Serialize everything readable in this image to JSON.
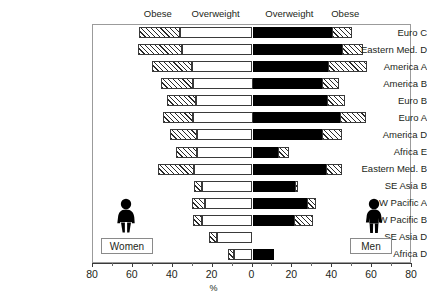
{
  "chart_data": {
    "type": "bar",
    "orientation": "horizontal-diverging",
    "title": "",
    "xlabel": "%",
    "ylabel": "",
    "xlim": [
      -80,
      80
    ],
    "xticks": [
      -80,
      -60,
      -40,
      -20,
      0,
      20,
      40,
      60,
      80
    ],
    "xticklabels": [
      "80",
      "60",
      "40",
      "20",
      "0",
      "20",
      "40",
      "60",
      "80"
    ],
    "minor_tick_step": 10,
    "grid": false,
    "legend_position": "inline-figures",
    "header_labels": [
      {
        "text": "Obese",
        "side": "women"
      },
      {
        "text": "Overweight",
        "side": "women"
      },
      {
        "text": "Overweight",
        "side": "men"
      },
      {
        "text": "Obese",
        "side": "men"
      }
    ],
    "categories": [
      "Euro C",
      "Eastern Med. D",
      "America A",
      "America B",
      "Euro B",
      "Euro A",
      "America D",
      "Africa E",
      "Eastern Med. B",
      "SE Asia B",
      "W Pacific A",
      "W Pacific B",
      "SE Asia D",
      "Africa D"
    ],
    "series": [
      {
        "name": "Women overweight",
        "side": "left",
        "pattern": "white",
        "values": [
          36.5,
          35.5,
          30.5,
          30.0,
          28.5,
          30.0,
          28.0,
          28.0,
          29.5,
          25.5,
          24.0,
          25.5,
          18.0,
          9.5
        ]
      },
      {
        "name": "Women obese",
        "side": "left",
        "pattern": "hatched",
        "values": [
          20.5,
          22.0,
          20.0,
          16.0,
          14.5,
          15.0,
          13.5,
          10.5,
          18.0,
          4.0,
          6.5,
          4.5,
          4.0,
          3.0
        ]
      },
      {
        "name": "Men overweight",
        "side": "right",
        "pattern": "black",
        "values": [
          40.0,
          45.0,
          38.0,
          35.0,
          37.5,
          44.0,
          35.0,
          13.0,
          37.0,
          21.5,
          27.5,
          21.0,
          0.0,
          11.0
        ]
      },
      {
        "name": "Men obese",
        "side": "right",
        "pattern": "hatched",
        "values": [
          10.0,
          10.5,
          19.5,
          8.5,
          9.0,
          13.0,
          10.0,
          5.5,
          8.0,
          1.5,
          4.5,
          9.5,
          0.0,
          0.0
        ]
      }
    ]
  },
  "legend": {
    "women_label": "Women",
    "men_label": "Men",
    "women_icon": "female-figure-icon",
    "men_icon": "male-figure-icon"
  },
  "colors": {
    "black": "#000000",
    "white": "#ffffff",
    "outline": "#3a3a3a",
    "frame": "#9b9b9b",
    "text": "#231f20"
  }
}
